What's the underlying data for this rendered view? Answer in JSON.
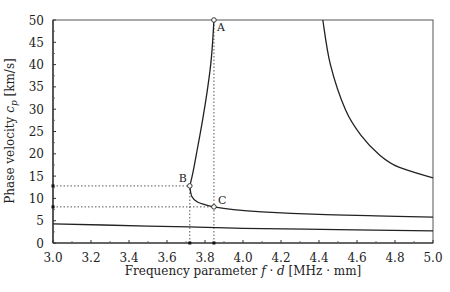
{
  "chart_data": {
    "type": "line",
    "title": "",
    "xlabel": "Frequency parameter f · d [MHz · mm]",
    "ylabel": "Phase velocity c_p [km/s]",
    "xlabel_parts": {
      "prefix": "Frequency parameter ",
      "f": "f",
      "dot": " · ",
      "d": "d",
      "suffix": " [MHz · mm]"
    },
    "ylabel_parts": {
      "prefix": "Phase velocity ",
      "c": "c",
      "sub": "p",
      "suffix": " [km/s]"
    },
    "xlim": [
      3.0,
      5.0
    ],
    "ylim": [
      0,
      50
    ],
    "x_ticks": [
      "3.0",
      "3.2",
      "3.4",
      "3.6",
      "3.8",
      "4.0",
      "4.2",
      "4.4",
      "4.6",
      "4.8",
      "5.0"
    ],
    "y_ticks": [
      "0",
      "5",
      "10",
      "15",
      "20",
      "25",
      "30",
      "35",
      "40",
      "45",
      "50"
    ],
    "grid": false,
    "series": [
      {
        "name": "mode-1",
        "x": [
          3.0,
          3.5,
          3.72,
          4.0,
          4.5,
          5.0
        ],
        "y": [
          4.3,
          3.8,
          3.6,
          3.3,
          3.0,
          2.7
        ]
      },
      {
        "name": "mode-2",
        "x": [
          3.72,
          3.73,
          3.76,
          3.8,
          3.847,
          3.95,
          4.1,
          4.4,
          4.7,
          5.0
        ],
        "y": [
          12.8,
          10.5,
          9.2,
          8.6,
          8.1,
          7.5,
          7.0,
          6.4,
          6.1,
          5.8
        ]
      },
      {
        "name": "mode-2-branch",
        "x": [
          3.72,
          3.735,
          3.755,
          3.785,
          3.81,
          3.83,
          3.84,
          3.847
        ],
        "y": [
          12.8,
          15.5,
          20.0,
          27.0,
          33.6,
          40.0,
          45.0,
          50.0
        ]
      },
      {
        "name": "mode-3",
        "x": [
          4.42,
          4.46,
          4.54,
          4.62,
          4.72,
          4.82,
          5.0
        ],
        "y": [
          50.0,
          40.0,
          29.8,
          24.2,
          19.7,
          17.0,
          14.6
        ]
      }
    ],
    "annotations": [
      {
        "label": "A",
        "x": 3.847,
        "y": 50.0
      },
      {
        "label": "B",
        "x": 3.72,
        "y": 12.8
      },
      {
        "label": "C",
        "x": 3.847,
        "y": 8.1
      }
    ],
    "guide_lines": [
      {
        "type": "h",
        "y": 12.8,
        "x_end": 3.72
      },
      {
        "type": "h",
        "y": 8.1,
        "x_end": 3.847
      },
      {
        "type": "v",
        "x": 3.72,
        "y_end": 12.8
      },
      {
        "type": "v",
        "x": 3.847,
        "y_end": 50.0
      }
    ],
    "legend": null
  }
}
